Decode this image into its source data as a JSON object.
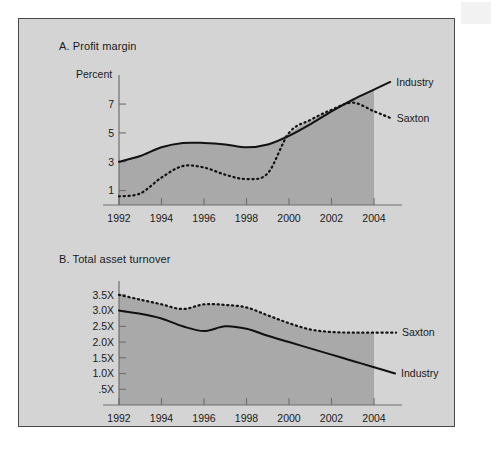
{
  "figure": {
    "background_color": "#d4d4d4",
    "fill_color": "#a9a9a9",
    "line_color": "#111111",
    "border_color": "#4a4a4a"
  },
  "chart_data": [
    {
      "type": "line",
      "panel": "A",
      "title": "A. Profit margin",
      "ylabel": "Percent",
      "xlabel": "",
      "grid": false,
      "legend_position": "right-inline",
      "xlim": [
        1992,
        2004
      ],
      "ylim": [
        0,
        8.6
      ],
      "yticks": [
        1,
        3,
        5,
        7
      ],
      "ytick_labels": [
        "1",
        "3",
        "5",
        "7"
      ],
      "xticks": [
        1992,
        1994,
        1996,
        1998,
        2000,
        2002,
        2004
      ],
      "xtick_labels": [
        "1992",
        "1994",
        "1996",
        "1998",
        "2000",
        "2002",
        "2004"
      ],
      "x": [
        1992,
        1993,
        1994,
        1995,
        1996,
        1997,
        1998,
        1999,
        2000,
        2001,
        2002,
        2003,
        2004
      ],
      "series": [
        {
          "name": "Industry",
          "style": "solid",
          "values": [
            3.0,
            3.4,
            4.0,
            4.3,
            4.3,
            4.2,
            4.0,
            4.2,
            4.8,
            5.6,
            6.5,
            7.3,
            8.0
          ]
        },
        {
          "name": "Saxton",
          "style": "dashed",
          "values": [
            0.6,
            0.8,
            1.9,
            2.7,
            2.6,
            2.1,
            1.8,
            2.2,
            5.0,
            5.9,
            6.6,
            7.1,
            6.5
          ]
        }
      ]
    },
    {
      "type": "line",
      "panel": "B",
      "title": "B. Total asset turnover",
      "ylabel": "",
      "xlabel": "",
      "grid": false,
      "legend_position": "right-inline",
      "xlim": [
        1992,
        2004
      ],
      "ylim": [
        0,
        3.75
      ],
      "yticks": [
        0.5,
        1.0,
        1.5,
        2.0,
        2.5,
        3.0,
        3.5
      ],
      "ytick_labels": [
        ".5X",
        "1.0X",
        "1.5X",
        "2.0X",
        "2.5X",
        "3.0X",
        "3.5X"
      ],
      "xticks": [
        1992,
        1994,
        1996,
        1998,
        2000,
        2002,
        2004
      ],
      "xtick_labels": [
        "1992",
        "1994",
        "1996",
        "1998",
        "2000",
        "2002",
        "2004"
      ],
      "x": [
        1992,
        1993,
        1994,
        1995,
        1996,
        1997,
        1998,
        1999,
        2000,
        2001,
        2002,
        2003,
        2004
      ],
      "series": [
        {
          "name": "Saxton",
          "style": "dashed",
          "values": [
            3.5,
            3.35,
            3.2,
            3.05,
            3.2,
            3.18,
            3.1,
            2.85,
            2.6,
            2.4,
            2.32,
            2.3,
            2.3
          ]
        },
        {
          "name": "Industry",
          "style": "solid",
          "values": [
            3.0,
            2.9,
            2.75,
            2.5,
            2.35,
            2.5,
            2.42,
            2.2,
            2.0,
            1.8,
            1.6,
            1.4,
            1.2
          ]
        }
      ]
    }
  ]
}
